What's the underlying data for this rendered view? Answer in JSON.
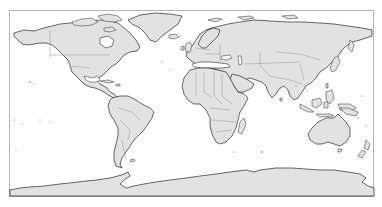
{
  "map": {
    "projection": "plate-carree",
    "extent": {
      "lon": [
        -180,
        180
      ],
      "lat": [
        -90,
        90
      ]
    },
    "frame": {
      "x": 9,
      "y": 10,
      "width": 365,
      "height": 187
    },
    "colors": {
      "land": "#e2e2e2",
      "ocean": "#ffffff",
      "coastline": "#2a2a2a",
      "country_border": "#8c8c8c",
      "frame": "#b4b4b4"
    },
    "features": [
      "coastlines",
      "country-borders"
    ],
    "continents": [
      "North America",
      "South America",
      "Europe",
      "Africa",
      "Asia",
      "Oceania",
      "Antarctica"
    ]
  }
}
